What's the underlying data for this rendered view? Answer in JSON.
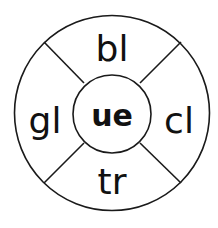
{
  "wheel": {
    "center": "ue",
    "segments": {
      "top": "bl",
      "right": "cl",
      "bottom": "tr",
      "left": "gl"
    },
    "stroke_color": "#1a1a1a",
    "text_color": "#111111"
  }
}
